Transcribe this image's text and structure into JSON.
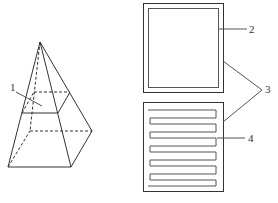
{
  "diagram": {
    "type": "technical-illustration",
    "colors": {
      "line": "#333333",
      "inner": "#555555",
      "background": "#ffffff"
    },
    "labels": [
      {
        "id": "1",
        "text": "1",
        "target": "pyramid cross-section plane"
      },
      {
        "id": "2",
        "text": "2",
        "target": "inner square frame of top panel"
      },
      {
        "id": "3",
        "text": "3",
        "target": "both square panels"
      },
      {
        "id": "4",
        "text": "4",
        "target": "serpentine strip pattern of bottom panel"
      }
    ],
    "parts": {
      "pyramid": "square pyramid with dashed hidden edges and horizontal section",
      "top_panel": "square with inset square border",
      "bottom_panel": "square with serpentine meander strips"
    }
  }
}
